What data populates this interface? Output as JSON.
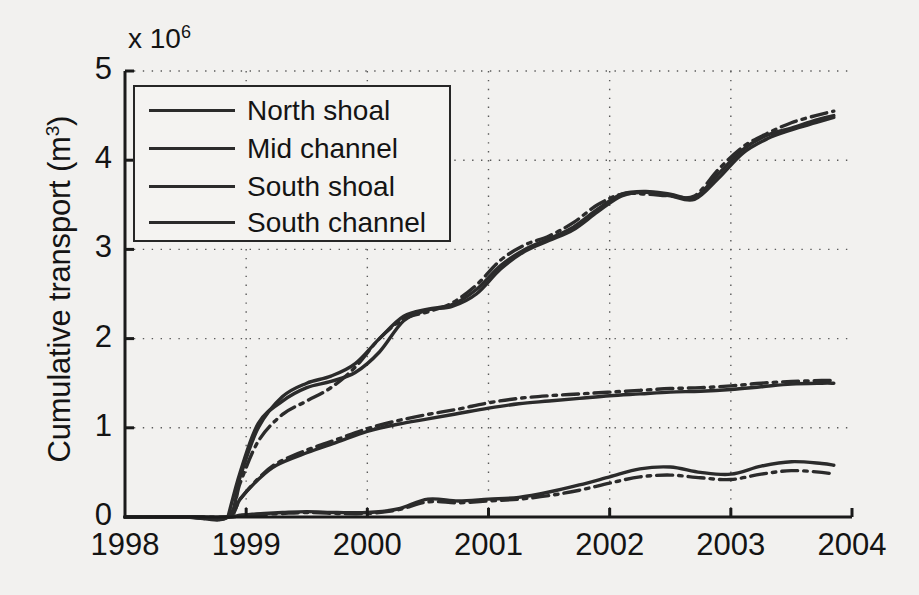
{
  "figure": {
    "exponent_label": "x 10",
    "exponent_sup": "6",
    "ylabel_text": "Cumulative transport (m",
    "ylabel_sup": "3",
    "ylabel_tail": ")"
  },
  "legend": {
    "items": [
      {
        "label": "North shoal",
        "style": "solid"
      },
      {
        "label": "Mid channel",
        "style": "solid"
      },
      {
        "label": "South shoal",
        "style": "solid"
      },
      {
        "label": "South channel",
        "style": "solid"
      }
    ]
  },
  "chart_data": {
    "type": "line",
    "title": "",
    "xlabel": "",
    "ylabel": "Cumulative transport (m^3)",
    "y_exponent": 1000000,
    "xlim": [
      1998,
      2004
    ],
    "ylim": [
      0,
      5
    ],
    "xticks": [
      1998,
      1999,
      2000,
      2001,
      2002,
      2003,
      2004
    ],
    "yticks": [
      0,
      1,
      2,
      3,
      4,
      5
    ],
    "xtick_labels": [
      "1998",
      "1999",
      "2000",
      "2001",
      "2002",
      "2003",
      "2004"
    ],
    "ytick_labels": [
      "0",
      "1",
      "2",
      "3",
      "4",
      "5"
    ],
    "grid": true,
    "grid_style": "dotted",
    "legend_position": "upper left",
    "series": [
      {
        "name": "North shoal",
        "style": "solid",
        "color": "#2b2b2b",
        "x": [
          1998.0,
          1998.5,
          1998.85,
          1998.95,
          1999.05,
          1999.15,
          1999.3,
          1999.5,
          1999.75,
          2000.0,
          2000.25,
          2000.5,
          2000.75,
          2001.0,
          2001.25,
          2001.5,
          2001.75,
          2002.0,
          2002.25,
          2002.5,
          2002.75,
          2003.0,
          2003.25,
          2003.5,
          2003.75,
          2003.85
        ],
        "y": [
          0.0,
          0.0,
          0.0,
          0.02,
          0.03,
          0.04,
          0.05,
          0.06,
          0.05,
          0.05,
          0.09,
          0.2,
          0.18,
          0.2,
          0.22,
          0.28,
          0.36,
          0.45,
          0.54,
          0.56,
          0.5,
          0.48,
          0.57,
          0.62,
          0.6,
          0.58
        ]
      },
      {
        "name": "Mid channel",
        "style": "dashdot",
        "color": "#2b2b2b",
        "x": [
          1998.0,
          1998.5,
          1998.85,
          1998.95,
          1999.05,
          1999.15,
          1999.3,
          1999.5,
          1999.75,
          2000.0,
          2000.25,
          2000.5,
          2000.75,
          2001.0,
          2001.25,
          2001.5,
          2001.75,
          2002.0,
          2002.25,
          2002.5,
          2002.75,
          2003.0,
          2003.25,
          2003.5,
          2003.75,
          2003.85
        ],
        "y": [
          0.0,
          0.0,
          0.0,
          0.015,
          0.025,
          0.03,
          0.04,
          0.05,
          0.04,
          0.04,
          0.08,
          0.17,
          0.16,
          0.18,
          0.2,
          0.24,
          0.3,
          0.38,
          0.45,
          0.47,
          0.44,
          0.42,
          0.48,
          0.52,
          0.5,
          0.48
        ]
      },
      {
        "name": "South shoal",
        "style": "solid",
        "color": "#2b2b2b",
        "x": [
          1998.0,
          1998.5,
          1998.85,
          1998.95,
          1999.1,
          1999.25,
          1999.5,
          1999.75,
          2000.0,
          2000.25,
          2000.5,
          2000.75,
          2001.0,
          2001.25,
          2001.5,
          2001.75,
          2002.0,
          2002.25,
          2002.5,
          2002.75,
          2003.0,
          2003.25,
          2003.5,
          2003.75,
          2003.85
        ],
        "y": [
          0.0,
          0.0,
          0.0,
          0.2,
          0.42,
          0.58,
          0.72,
          0.84,
          0.96,
          1.04,
          1.1,
          1.16,
          1.22,
          1.27,
          1.3,
          1.33,
          1.36,
          1.38,
          1.4,
          1.41,
          1.43,
          1.46,
          1.49,
          1.5,
          1.5
        ]
      },
      {
        "name": "South channel",
        "style": "dashdot",
        "color": "#2b2b2b",
        "x": [
          1998.0,
          1998.5,
          1998.85,
          1998.95,
          1999.1,
          1999.25,
          1999.5,
          1999.75,
          2000.0,
          2000.25,
          2000.5,
          2000.75,
          2001.0,
          2001.25,
          2001.5,
          2001.75,
          2002.0,
          2002.25,
          2002.5,
          2002.75,
          2003.0,
          2003.25,
          2003.5,
          2003.75,
          2003.85
        ],
        "y": [
          0.0,
          0.0,
          0.0,
          0.2,
          0.43,
          0.6,
          0.75,
          0.87,
          0.99,
          1.08,
          1.15,
          1.21,
          1.28,
          1.33,
          1.36,
          1.38,
          1.4,
          1.42,
          1.44,
          1.45,
          1.47,
          1.5,
          1.52,
          1.53,
          1.53
        ]
      },
      {
        "name": "Upper curve A",
        "style": "solid",
        "color": "#2b2b2b",
        "x": [
          1998.0,
          1998.5,
          1998.85,
          1998.95,
          1999.1,
          1999.3,
          1999.5,
          1999.7,
          1999.9,
          2000.1,
          2000.3,
          2000.5,
          2000.7,
          2000.9,
          2001.1,
          2001.3,
          2001.5,
          2001.7,
          2001.9,
          2002.1,
          2002.3,
          2002.5,
          2002.7,
          2002.9,
          2003.1,
          2003.3,
          2003.5,
          2003.7,
          2003.85
        ],
        "y": [
          0.0,
          0.0,
          0.0,
          0.45,
          1.0,
          1.35,
          1.5,
          1.58,
          1.72,
          2.0,
          2.25,
          2.33,
          2.38,
          2.55,
          2.82,
          3.0,
          3.12,
          3.25,
          3.45,
          3.62,
          3.65,
          3.62,
          3.58,
          3.85,
          4.12,
          4.28,
          4.36,
          4.45,
          4.5
        ]
      },
      {
        "name": "Upper curve B",
        "style": "dashdot",
        "color": "#2b2b2b",
        "x": [
          1998.0,
          1998.5,
          1998.85,
          1998.95,
          1999.1,
          1999.3,
          1999.5,
          1999.7,
          1999.9,
          2000.1,
          2000.3,
          2000.5,
          2000.7,
          2000.9,
          2001.1,
          2001.3,
          2001.5,
          2001.7,
          2001.9,
          2002.1,
          2002.3,
          2002.5,
          2002.7,
          2002.9,
          2003.1,
          2003.3,
          2003.5,
          2003.7,
          2003.85
        ],
        "y": [
          0.0,
          0.0,
          0.0,
          0.38,
          0.85,
          1.15,
          1.3,
          1.45,
          1.68,
          2.0,
          2.22,
          2.3,
          2.4,
          2.6,
          2.88,
          3.05,
          3.15,
          3.3,
          3.5,
          3.62,
          3.62,
          3.6,
          3.6,
          3.9,
          4.15,
          4.3,
          4.42,
          4.5,
          4.55
        ]
      },
      {
        "name": "Mid pair A",
        "style": "solid",
        "color": "#2b2b2b",
        "x": [
          1998.85,
          1998.95,
          1999.1,
          1999.3,
          1999.5,
          1999.7,
          1999.9,
          2000.1,
          2000.3,
          2000.5,
          2000.7,
          2000.9,
          2001.1,
          2001.3,
          2001.5,
          2001.7,
          2001.9,
          2002.1,
          2002.3,
          2002.5,
          2002.7,
          2002.9,
          2003.1,
          2003.3,
          2003.5,
          2003.7,
          2003.85
        ],
        "y": [
          0.0,
          0.5,
          1.05,
          1.3,
          1.45,
          1.52,
          1.62,
          1.85,
          2.2,
          2.32,
          2.36,
          2.5,
          2.78,
          2.98,
          3.1,
          3.22,
          3.42,
          3.6,
          3.64,
          3.6,
          3.56,
          3.8,
          4.08,
          4.24,
          4.34,
          4.42,
          4.48
        ]
      }
    ],
    "annotations": [
      {
        "text": "x 10^6",
        "position": "top-left-of-axis"
      }
    ]
  }
}
